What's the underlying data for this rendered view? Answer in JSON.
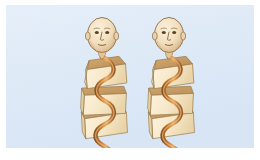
{
  "scene": {
    "title": "Two anatomical figures with spiral coils around stacked blocks",
    "background_color": "#dfeaf7",
    "page_color": "#ffffff",
    "panel": {
      "x": 6,
      "y": 5,
      "width": 248,
      "height": 143
    }
  },
  "palette": {
    "background_blue": "#dfeaf7",
    "background_blue_light": "#e9f1fa",
    "page_white": "#ffffff",
    "skin_light": "#f6e4c8",
    "skin_mid": "#ecd2ab",
    "skin_shadow": "#d9b98c",
    "outline_brown": "#7a5a36",
    "box_front": "#f7e7c8",
    "box_front_shadow": "#eeda b3",
    "box_top": "#c49a62",
    "box_side": "#e8d2a6",
    "box_outline": "#9a7c4e",
    "coil_light": "#e09a4e",
    "coil_mid": "#c87a30",
    "coil_dark": "#8a5220",
    "feature_dark": "#5c4126"
  },
  "figures": [
    {
      "id": "figure-left",
      "label": "Left figure",
      "head": {
        "label": "Bald head",
        "center_x": 100,
        "center_y": 33,
        "radius_x": 15,
        "radius_y": 18,
        "features": [
          "left-eye",
          "right-eye",
          "nose",
          "mouth",
          "left-ear",
          "right-ear"
        ]
      },
      "neck": {
        "label": "Neck",
        "x": 100,
        "y": 50
      },
      "blocks": [
        {
          "label": "Upper block",
          "x": 78,
          "y": 54,
          "width": 44,
          "height": 26,
          "rotation": -4
        },
        {
          "label": "Middle block",
          "x": 76,
          "y": 80,
          "width": 46,
          "height": 26,
          "rotation": 3
        },
        {
          "label": "Lower block",
          "x": 75,
          "y": 104,
          "width": 46,
          "height": 26,
          "rotation": -3
        }
      ],
      "coil": {
        "label": "Spiral coil",
        "turns": 3,
        "top_y": 50,
        "bottom_y": 140,
        "color": "#c87a30"
      }
    },
    {
      "id": "figure-right",
      "label": "Right figure",
      "head": {
        "label": "Bald head",
        "center_x": 167,
        "center_y": 33,
        "radius_x": 15,
        "radius_y": 18,
        "features": [
          "left-eye",
          "right-eye",
          "nose",
          "mouth",
          "left-ear",
          "right-ear"
        ]
      },
      "neck": {
        "label": "Neck",
        "x": 167,
        "y": 50
      },
      "blocks": [
        {
          "label": "Upper block",
          "x": 146,
          "y": 54,
          "width": 44,
          "height": 26,
          "rotation": -4
        },
        {
          "label": "Middle block",
          "x": 144,
          "y": 80,
          "width": 46,
          "height": 26,
          "rotation": 3
        },
        {
          "label": "Lower block",
          "x": 143,
          "y": 104,
          "width": 46,
          "height": 26,
          "rotation": -3
        }
      ],
      "coil": {
        "label": "Spiral coil",
        "turns": 3,
        "top_y": 50,
        "bottom_y": 144,
        "color": "#c87a30"
      }
    }
  ]
}
